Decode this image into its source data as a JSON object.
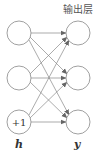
{
  "diagram": {
    "title": "输出层",
    "left_layer": {
      "label": "h",
      "nodes": [
        "",
        "",
        "+1"
      ]
    },
    "right_layer": {
      "label": "y",
      "nodes": [
        "",
        "",
        ""
      ]
    },
    "connections": "fully-connected (each left node to each right node)",
    "colors": {
      "stroke": "#888888",
      "text": "#333333"
    }
  }
}
